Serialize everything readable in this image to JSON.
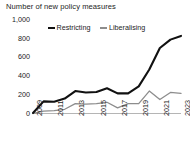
{
  "chart_data": {
    "type": "line",
    "title": "Number of new policy measures",
    "subtitle": "",
    "xlabel": "",
    "ylabel": "",
    "x": [
      2009,
      2010,
      2011,
      2012,
      2013,
      2014,
      2015,
      2016,
      2017,
      2018,
      2019,
      2020,
      2021,
      2022,
      2023
    ],
    "xtick_labels": [
      "2009",
      "2011",
      "2013",
      "2015",
      "2017",
      "2019",
      "2021",
      "2023"
    ],
    "xtick_values": [
      2009,
      2011,
      2013,
      2015,
      2017,
      2019,
      2021,
      2023
    ],
    "xlim": [
      2009,
      2023
    ],
    "ylim": [
      0,
      1000
    ],
    "ytick_labels": [
      "0",
      "200",
      "400",
      "600",
      "800",
      "1,000"
    ],
    "ytick_values": [
      0,
      200,
      400,
      600,
      800,
      1000
    ],
    "grid": false,
    "legend_position": "top-inside",
    "series": [
      {
        "name": "Restricting",
        "color": "#111111",
        "linewidth": 2.1,
        "values": [
          5,
          130,
          125,
          160,
          240,
          225,
          230,
          270,
          215,
          215,
          290,
          470,
          700,
          790,
          830
        ]
      },
      {
        "name": "Liberalising",
        "color": "#8d8d8d",
        "linewidth": 1.3,
        "values": [
          2,
          25,
          30,
          45,
          105,
          100,
          105,
          120,
          60,
          105,
          105,
          240,
          150,
          225,
          215
        ]
      }
    ]
  },
  "legend": {
    "entries": [
      {
        "label": "Restricting"
      },
      {
        "label": "Liberalising"
      }
    ]
  },
  "colors": {
    "restricting": "#111111",
    "liberalising": "#8d8d8d",
    "axis": "#b5b5b5",
    "text": "#1d1d1d",
    "background": "#ffffff"
  }
}
